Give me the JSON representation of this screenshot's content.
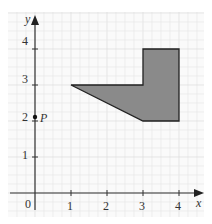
{
  "diagram": {
    "axes": {
      "x_label": "x",
      "y_label": "y",
      "origin_label": "0",
      "x_ticks": [
        "1",
        "2",
        "3",
        "4"
      ],
      "y_ticks": [
        "1",
        "2",
        "3",
        "4"
      ]
    },
    "point": {
      "label": "P",
      "x": 0,
      "y": 2
    },
    "shape": {
      "vertices": [
        [
          1,
          3
        ],
        [
          3,
          3
        ],
        [
          3,
          4
        ],
        [
          4,
          4
        ],
        [
          4,
          2
        ],
        [
          3,
          2
        ]
      ],
      "fill": "#8a8a8a"
    },
    "colors": {
      "grid": "#e4e4e4",
      "axis": "#333333",
      "background": "#ffffff"
    }
  }
}
